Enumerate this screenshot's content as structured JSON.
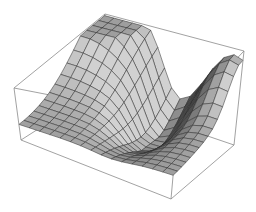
{
  "chart_data": {
    "type": "surface3d",
    "title": "",
    "xlabel": "",
    "ylabel": "",
    "zlabel": "",
    "axes_ticks": false,
    "bounding_box": true,
    "grid_resolution": [
      15,
      15
    ],
    "surface": {
      "peaks": [
        {
          "u": 0.05,
          "v": 0.95,
          "height": 1.0,
          "spread": 0.35
        },
        {
          "u": 0.95,
          "v": 0.95,
          "height": 0.85,
          "spread": 0.22
        }
      ],
      "valley": {
        "u": 0.6,
        "v": 0.75,
        "depth": 0.55
      },
      "base_level": 0.3
    },
    "box_corners_px": {
      "bottom": {
        "left": [
          21,
          140
        ],
        "front": [
          171,
          199
        ],
        "right": [
          234,
          145
        ],
        "back": [
          90,
          96
        ]
      },
      "top": {
        "left": [
          14,
          88
        ],
        "front": [
          178,
          120
        ],
        "right": [
          244,
          51
        ],
        "back": [
          105,
          14
        ]
      }
    },
    "colors": {
      "background": "#ffffff",
      "box": "#8a8a8a",
      "mesh": "#2a2a2a",
      "surface_light": "#c8c8c8",
      "surface_dark": "#1a1a1a"
    }
  }
}
